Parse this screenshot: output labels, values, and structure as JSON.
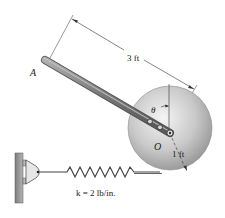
{
  "diagram": {
    "labels": {
      "point_a": "A",
      "point_o": "O",
      "angle": "θ",
      "rod_length": "3 ft",
      "disk_radius": "1 ft",
      "spring_constant": "k = 2 lb/in."
    },
    "colors": {
      "rod": "#7a7a7a",
      "disk": "#c8c8c8",
      "wall": "#9a9a9a",
      "line": "#333333"
    }
  }
}
